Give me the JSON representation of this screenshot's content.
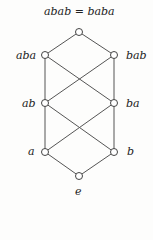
{
  "diagram": {
    "title": "abab = baba",
    "nodes": [
      {
        "id": "top",
        "label": "",
        "x": 79,
        "y": 32
      },
      {
        "id": "aba",
        "label": "aba",
        "x": 45,
        "y": 55
      },
      {
        "id": "bab",
        "label": "bab",
        "x": 114,
        "y": 55
      },
      {
        "id": "ab",
        "label": "ab",
        "x": 45,
        "y": 103
      },
      {
        "id": "ba",
        "label": "ba",
        "x": 114,
        "y": 103
      },
      {
        "id": "a",
        "label": "a",
        "x": 45,
        "y": 152
      },
      {
        "id": "b",
        "label": "b",
        "x": 114,
        "y": 152
      },
      {
        "id": "e",
        "label": "e",
        "x": 79,
        "y": 176
      }
    ],
    "edges": [
      [
        "top",
        "aba"
      ],
      [
        "top",
        "bab"
      ],
      [
        "aba",
        "ab"
      ],
      [
        "aba",
        "ba"
      ],
      [
        "bab",
        "ab"
      ],
      [
        "bab",
        "ba"
      ],
      [
        "ab",
        "a"
      ],
      [
        "ab",
        "b"
      ],
      [
        "ba",
        "a"
      ],
      [
        "ba",
        "b"
      ],
      [
        "a",
        "e"
      ],
      [
        "b",
        "e"
      ]
    ],
    "colors": {
      "line": "#555555",
      "node_fill": "#ffffff"
    }
  }
}
